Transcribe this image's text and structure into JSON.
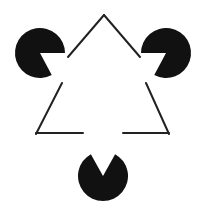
{
  "figure": {
    "canvas": {
      "width": 204,
      "height": 206,
      "background_color": "#ffffff"
    },
    "ink_color": "#111111",
    "stroke_color": "#222222",
    "stroke_width": 2.0,
    "inducers": [
      {
        "name": "pacman-top-left",
        "label": "Top-left pac-man inducer",
        "cx": 40,
        "cy": 53,
        "r": 25,
        "wedge_start_deg": 0,
        "wedge_end_deg": 62,
        "fill": "#111111"
      },
      {
        "name": "pacman-top-right",
        "label": "Top-right pac-man inducer",
        "cx": 166,
        "cy": 53,
        "r": 25,
        "wedge_start_deg": 118,
        "wedge_end_deg": 180,
        "fill": "#111111"
      },
      {
        "name": "pacman-bottom",
        "label": "Bottom pac-man inducer",
        "cx": 103,
        "cy": 176,
        "r": 25,
        "wedge_start_deg": 241,
        "wedge_end_deg": 299,
        "fill": "#111111"
      }
    ],
    "outline_triangle": {
      "name": "outline-triangle",
      "label": "Outlined triangle with three occluded gaps",
      "vertices": [
        {
          "name": "apex-top",
          "x": 104,
          "y": 15
        },
        {
          "name": "vertex-bottom-left",
          "x": 36,
          "y": 134
        },
        {
          "name": "vertex-bottom-right",
          "x": 169,
          "y": 134
        }
      ],
      "segments": [
        {
          "name": "segment-upper-left",
          "x1": 104,
          "y1": 15,
          "x2": 68,
          "y2": 57
        },
        {
          "name": "segment-lower-left",
          "x1": 62,
          "y1": 83,
          "x2": 36,
          "y2": 134
        },
        {
          "name": "segment-upper-right",
          "x1": 104,
          "y1": 15,
          "x2": 140,
          "y2": 57
        },
        {
          "name": "segment-lower-right",
          "x1": 146,
          "y1": 83,
          "x2": 169,
          "y2": 134
        },
        {
          "name": "segment-bottom-left",
          "x1": 36,
          "y1": 133,
          "x2": 83,
          "y2": 133
        },
        {
          "name": "segment-bottom-right",
          "x1": 123,
          "y1": 133,
          "x2": 169,
          "y2": 133
        }
      ]
    },
    "illusory_triangle": {
      "name": "illusory-triangle",
      "label": "Perceived (subjective) white triangle",
      "visible": false,
      "vertices": [
        {
          "x": 40,
          "y": 53
        },
        {
          "x": 166,
          "y": 53
        },
        {
          "x": 103,
          "y": 176
        }
      ]
    }
  }
}
